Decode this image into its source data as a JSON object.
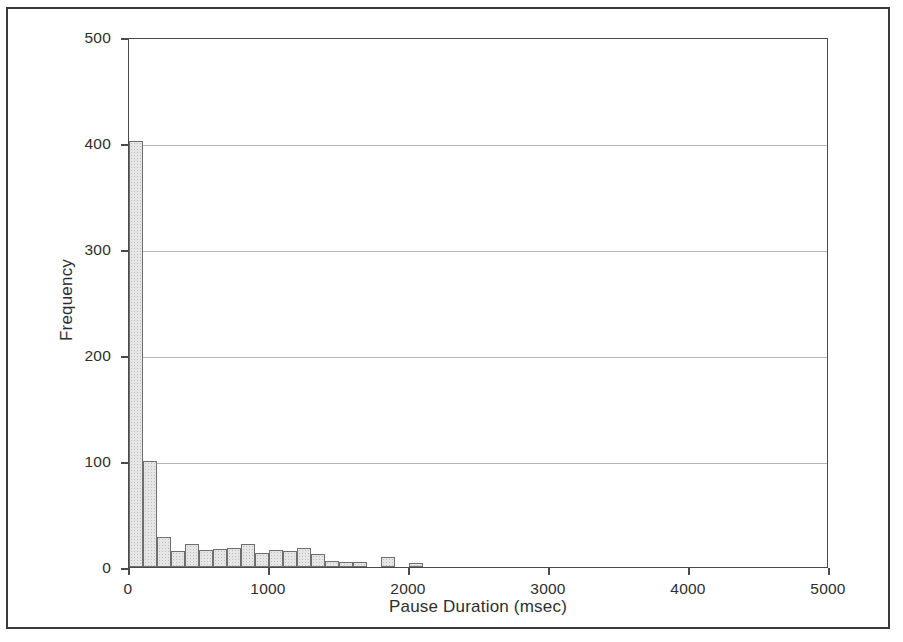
{
  "chart_data": {
    "type": "bar",
    "chart_subtype": "histogram",
    "title": "",
    "xlabel": "Pause Duration (msec)",
    "ylabel": "Frequency",
    "xlim": [
      0,
      5000
    ],
    "ylim": [
      0,
      500
    ],
    "xticks": [
      0,
      1000,
      2000,
      3000,
      4000,
      5000
    ],
    "xtick_labels": [
      "0",
      "1000",
      "2000",
      "3000",
      "4000",
      "5000"
    ],
    "yticks": [
      0,
      100,
      200,
      300,
      400,
      500
    ],
    "ytick_labels": [
      "0",
      "100",
      "200",
      "300",
      "400",
      "500"
    ],
    "grid": "horizontal",
    "legend": "none",
    "bin_width": 100,
    "bin_starts": [
      0,
      100,
      200,
      300,
      400,
      500,
      600,
      700,
      800,
      900,
      1000,
      1100,
      1200,
      1300,
      1400,
      1500,
      1600,
      1700,
      1800,
      1900,
      2000
    ],
    "categories": [
      "0-100",
      "100-200",
      "200-300",
      "300-400",
      "400-500",
      "500-600",
      "600-700",
      "700-800",
      "800-900",
      "900-1000",
      "1000-1100",
      "1100-1200",
      "1200-1300",
      "1300-1400",
      "1400-1500",
      "1500-1600",
      "1600-1700",
      "1700-1800",
      "1800-1900",
      "1900-2000",
      "2000-2100"
    ],
    "values": [
      402,
      100,
      28,
      15,
      22,
      16,
      17,
      18,
      22,
      13,
      16,
      15,
      18,
      12,
      6,
      5,
      5,
      0,
      9,
      0,
      4
    ],
    "bar_fill_color": "#e6e6e6",
    "bar_edge_color": "#6e6e6e",
    "grid_color": "#b6b6b6",
    "axis_color": "#4a4a4a",
    "frame_color": "#3a3a3a",
    "background_color": "#ffffff"
  }
}
